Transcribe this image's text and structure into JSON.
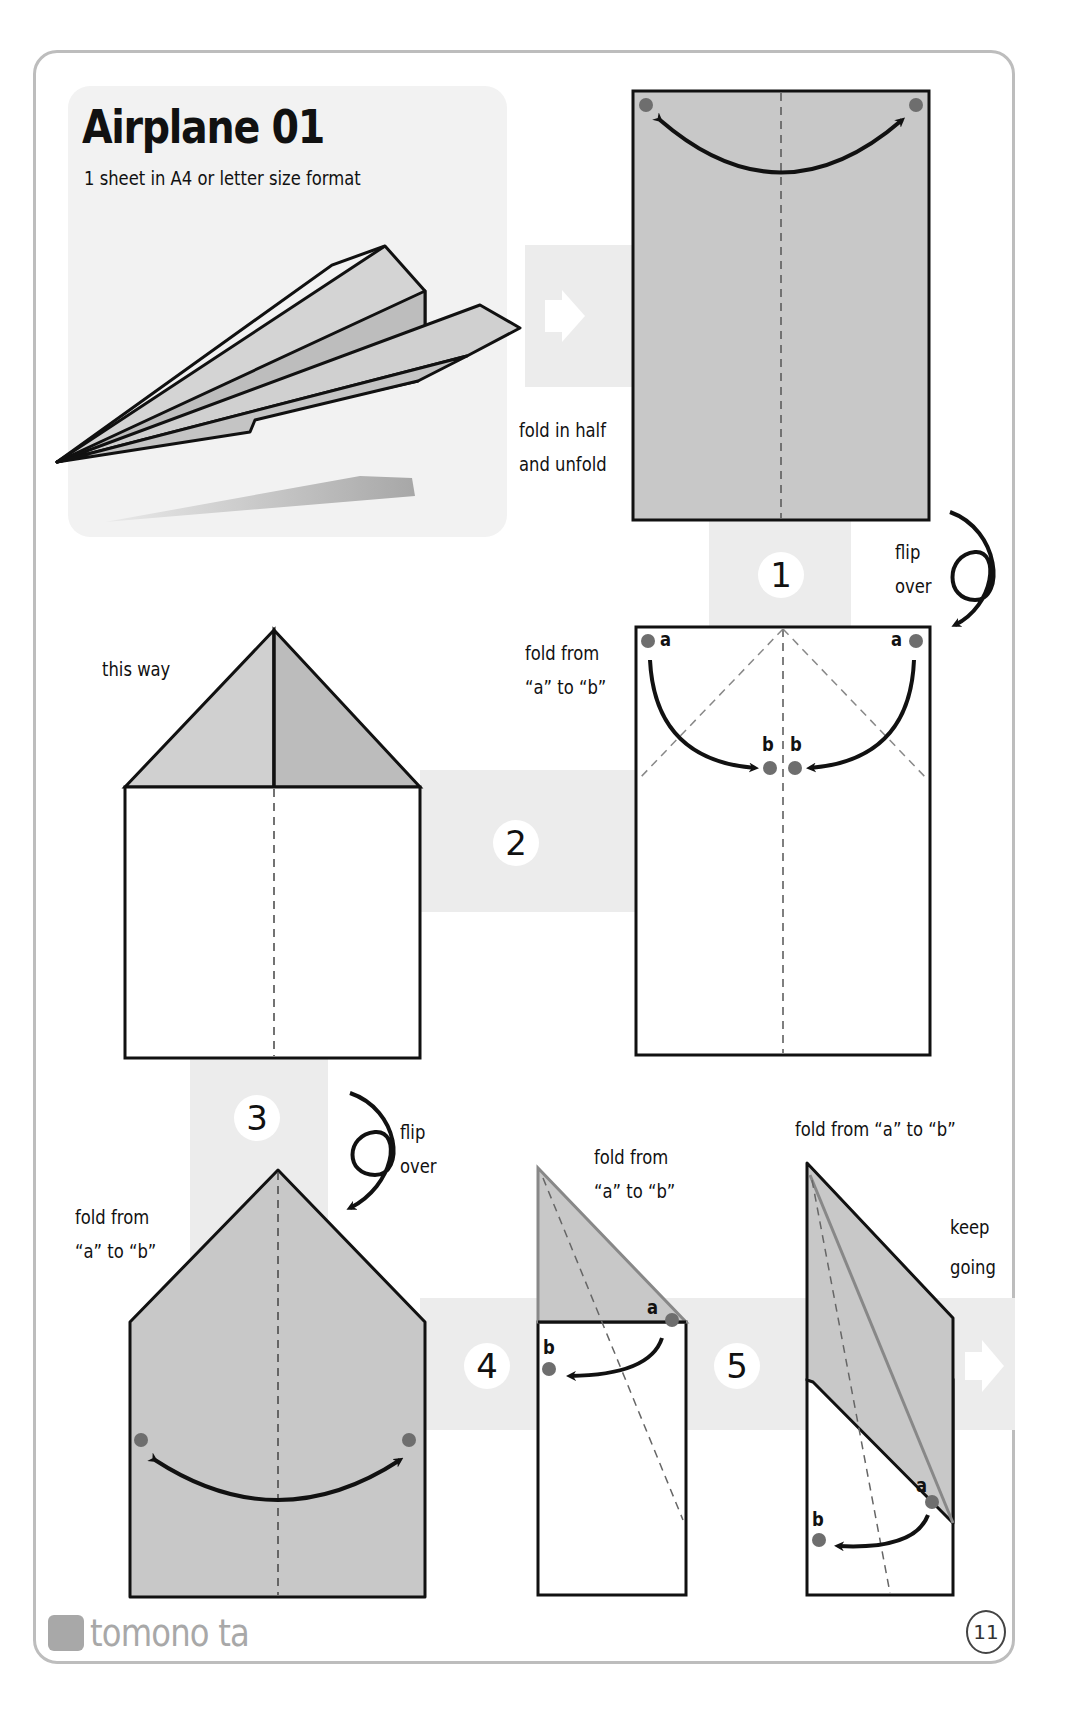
{
  "page": {
    "title": "Airplane 01",
    "subtitle": "1 sheet in A4 or letter size format",
    "page_number": "11",
    "brand": "tomono ta"
  },
  "colors": {
    "paper_gray": "#c8c8c8",
    "paper_white": "#ffffff",
    "band_gray": "#ececec",
    "dot_gray": "#6e6e6e",
    "outline": "#1a1a1a",
    "border": "#bdbdbd"
  },
  "steps": [
    {
      "id": "intro",
      "instruction_line1": "fold in half",
      "instruction_line2": "and unfold",
      "icon": "right-arrow-icon"
    },
    {
      "id": "1",
      "number": "1",
      "flip_line1": "flip",
      "flip_line2": "over",
      "instruction_line1": "fold from",
      "instruction_line2": "“a” to “b”",
      "point_labels": [
        "a",
        "a",
        "b",
        "b"
      ]
    },
    {
      "id": "2",
      "number": "2",
      "hint": "this way"
    },
    {
      "id": "3",
      "number": "3",
      "flip_line1": "flip",
      "flip_line2": "over",
      "instruction_line1": "fold from",
      "instruction_line2": "“a” to “b”"
    },
    {
      "id": "4",
      "number": "4",
      "instruction_line1": "fold from",
      "instruction_line2": "“a” to “b”",
      "point_labels": [
        "a",
        "b"
      ]
    },
    {
      "id": "5",
      "number": "5",
      "instruction": "fold from “a” to “b”",
      "continue_line1": "keep",
      "continue_line2": "going",
      "point_labels": [
        "a",
        "b"
      ]
    }
  ]
}
